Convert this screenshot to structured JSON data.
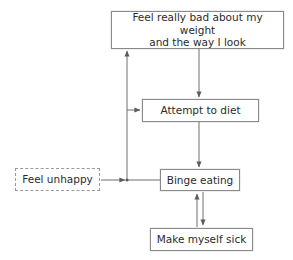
{
  "diagram": {
    "type": "flowchart",
    "background_color": "#ffffff",
    "node_border_color": "#8a8a8a",
    "dashed_border_color": "#9a9a9a",
    "text_color": "#2b2b2b",
    "connector_color": "#6f6f6f",
    "nodes": [
      {
        "id": "feel_bad",
        "label": "Feel really bad about my weight\nand the way I look",
        "border_style": "solid",
        "shape": "rectangle"
      },
      {
        "id": "attempt_diet",
        "label": "Attempt to diet",
        "border_style": "solid",
        "shape": "rectangle"
      },
      {
        "id": "binge_eating",
        "label": "Binge eating",
        "border_style": "solid",
        "shape": "rectangle"
      },
      {
        "id": "make_sick",
        "label": "Make myself sick",
        "border_style": "solid",
        "shape": "rectangle"
      },
      {
        "id": "feel_unhappy",
        "label": "Feel unhappy",
        "border_style": "dashed",
        "shape": "rectangle"
      }
    ],
    "edges": [
      {
        "from": "feel_bad",
        "to": "attempt_diet",
        "style": "solid",
        "arrow": "end"
      },
      {
        "from": "attempt_diet",
        "to": "binge_eating",
        "style": "solid",
        "arrow": "end"
      },
      {
        "from": "binge_eating",
        "to": "make_sick",
        "style": "solid",
        "arrow": "end"
      },
      {
        "from": "make_sick",
        "to": "binge_eating",
        "style": "solid",
        "arrow": "end"
      },
      {
        "from": "binge_eating",
        "to": "feel_bad",
        "style": "solid",
        "arrow": "end"
      },
      {
        "from": "binge_eating",
        "to": "attempt_diet",
        "style": "solid",
        "arrow": "end"
      },
      {
        "from": "feel_unhappy",
        "to": "binge_eating",
        "style": "solid",
        "arrow": "end"
      }
    ]
  }
}
